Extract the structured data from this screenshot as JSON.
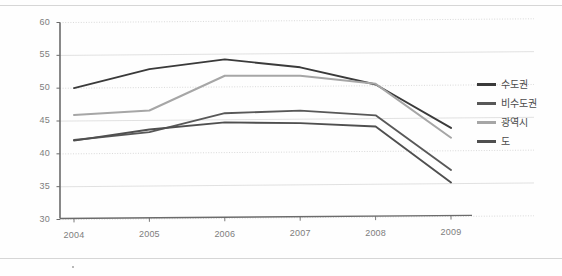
{
  "chart_data": {
    "type": "line",
    "title": "",
    "xlabel": "",
    "ylabel": "",
    "categories": [
      "2004",
      "2005",
      "2006",
      "2007",
      "2008",
      "2009"
    ],
    "x": [
      2004,
      2005,
      2006,
      2007,
      2008,
      2009
    ],
    "ylim": [
      30,
      60
    ],
    "yticks": [
      30,
      35,
      40,
      45,
      50,
      55,
      60
    ],
    "grid": true,
    "legend_position": "right",
    "series": [
      {
        "name": "수도권",
        "color": "#3a3a3a",
        "values": [
          50.0,
          52.8,
          54.2,
          52.9,
          50.2,
          43.5
        ]
      },
      {
        "name": "비수도권",
        "color": "#585858",
        "values": [
          42.1,
          43.2,
          46.0,
          46.3,
          45.5,
          37.1
        ]
      },
      {
        "name": "광역시",
        "color": "#a6a6a6",
        "values": [
          45.9,
          46.5,
          51.7,
          51.6,
          50.3,
          42.0
        ]
      },
      {
        "name": "도",
        "color": "#4f4f4f",
        "values": [
          42.0,
          43.6,
          44.6,
          44.4,
          43.8,
          35.2
        ]
      }
    ]
  },
  "axis": {
    "y_tick_labels": [
      "60",
      "55",
      "50",
      "45",
      "40",
      "35",
      "30"
    ],
    "x_tick_labels": [
      "2004",
      "2005",
      "2006",
      "2007",
      "2008",
      "2009"
    ]
  },
  "legend": {
    "items": [
      {
        "label": "수도권",
        "color": "#3a3a3a"
      },
      {
        "label": "비수도권",
        "color": "#585858"
      },
      {
        "label": "광역시",
        "color": "#a6a6a6"
      },
      {
        "label": "도",
        "color": "#4f4f4f"
      }
    ]
  },
  "colors": {
    "axis_line": "#6b6b6b",
    "grid_line": "#d9d9d9",
    "grid_line_dotted": "#cfcfcf",
    "tick_text": "#7d7d7d"
  }
}
